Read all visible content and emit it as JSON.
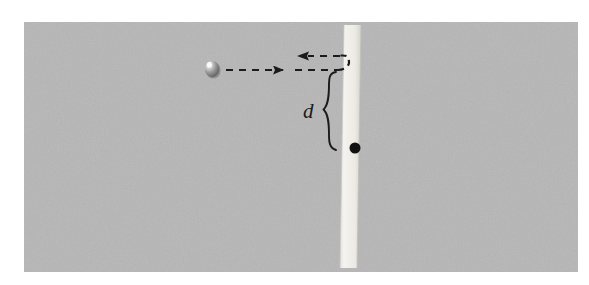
{
  "figure": {
    "type": "physics-diagram",
    "canvas": {
      "width": 589,
      "height": 285,
      "background_color": "#ffffff"
    }
  },
  "panel": {
    "name": "gray-background-panel",
    "x": 24,
    "y": 22,
    "width": 554,
    "height": 250,
    "fill_color": "#b6b6b6",
    "texture": "fine-grain-noise"
  },
  "wall": {
    "name": "vertical-wall",
    "label": "",
    "x_top": 344,
    "x_bottom": 340,
    "y_top": 25,
    "y_bottom": 268,
    "thickness": 17,
    "fill_color": "#f1f0eb",
    "edge_color": "#d8d7d0"
  },
  "ball": {
    "name": "ball",
    "label": "",
    "cx": 212,
    "cy": 69,
    "radius": 7.5,
    "body_color": "#8c8c8c",
    "shadow_color": "#6d6d6d",
    "highlight_color": "#fbfbfb"
  },
  "pivot": {
    "name": "pivot-point",
    "label": "",
    "cx": 355,
    "cy": 148,
    "radius": 5.5,
    "color": "#111111"
  },
  "trajectory": {
    "incoming": {
      "name": "incoming-path",
      "label": "",
      "y": 70,
      "x_start": 226,
      "x_end": 338,
      "direction": "right",
      "arrowhead_x": 288,
      "style": "dashed",
      "color": "#1b1b1b"
    },
    "outgoing": {
      "name": "outgoing-path",
      "label": "",
      "y": 56,
      "x_start": 340,
      "x_end": 298,
      "direction": "left",
      "arrowhead_x": 300,
      "style": "dashed",
      "color": "#1b1b1b"
    },
    "turnaround": {
      "name": "turnaround-curve",
      "label": "",
      "style": "dashed",
      "color": "#1b1b1b"
    }
  },
  "dimension": {
    "name": "distance-d",
    "label": "d",
    "brace_top_y": 72,
    "brace_bottom_y": 150,
    "brace_x": 336,
    "label_x": 303,
    "label_y": 101,
    "color": "#1b1b1b"
  }
}
